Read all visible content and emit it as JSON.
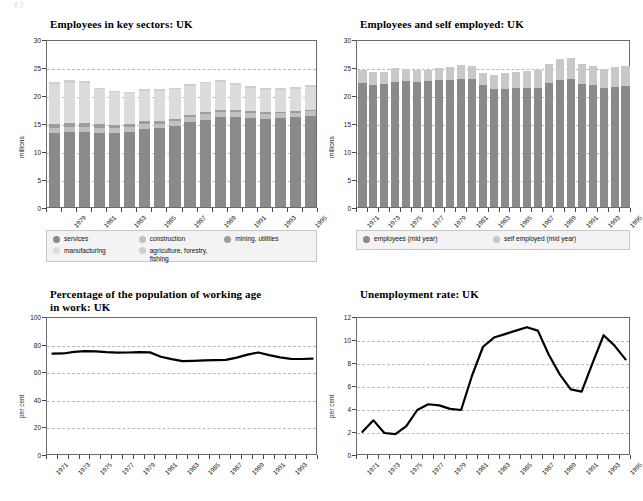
{
  "page": {
    "artifact": "g  y"
  },
  "charts": [
    {
      "id": "employees-key-sectors",
      "title": "Employees in key sectors: UK",
      "ylabel": "millions",
      "ylim": [
        0,
        30
      ],
      "yticks": [
        0,
        5,
        10,
        15,
        20,
        25,
        30
      ],
      "gridlines": [
        5,
        10,
        15,
        20,
        25
      ],
      "type": "bar",
      "legend": [
        {
          "label": "services",
          "color": "#8a8a8a"
        },
        {
          "label": "construction",
          "color": "#c0c0c0"
        },
        {
          "label": "mining, utilities",
          "color": "#9d9d9d"
        },
        {
          "label": "manufacturing",
          "color": "#dcdcdc"
        },
        {
          "label": "agriculture, forestry, fishing",
          "color": "#cfcfcf"
        }
      ],
      "categories": [
        "1978",
        "1979",
        "1980",
        "1981",
        "1982",
        "1983",
        "1984",
        "1985",
        "1986",
        "1987",
        "1988",
        "1989",
        "1990",
        "1991",
        "1992",
        "1993",
        "1994",
        "1995"
      ],
      "tick_labels": [
        "1979",
        "1981",
        "1983",
        "1985",
        "1987",
        "1989",
        "1991",
        "1993",
        "1995"
      ],
      "series": [
        {
          "name": "services",
          "values": [
            13.2,
            13.4,
            13.4,
            13.3,
            13.3,
            13.4,
            14.0,
            14.1,
            14.5,
            15.1,
            15.6,
            16.0,
            16.0,
            15.9,
            15.8,
            15.9,
            16.0,
            16.3
          ]
        },
        {
          "name": "construction",
          "values": [
            0.9,
            0.9,
            0.9,
            0.8,
            0.8,
            0.8,
            0.8,
            0.8,
            0.8,
            0.9,
            1.0,
            1.0,
            1.0,
            0.9,
            0.8,
            0.8,
            0.8,
            0.8
          ]
        },
        {
          "name": "mining, utilities",
          "values": [
            0.7,
            0.7,
            0.7,
            0.7,
            0.6,
            0.6,
            0.6,
            0.5,
            0.5,
            0.4,
            0.4,
            0.4,
            0.3,
            0.3,
            0.3,
            0.3,
            0.3,
            0.3
          ]
        },
        {
          "name": "manufacturing",
          "values": [
            7.1,
            7.2,
            7.1,
            6.2,
            5.8,
            5.5,
            5.3,
            5.3,
            5.2,
            5.2,
            5.1,
            5.0,
            4.5,
            4.2,
            4.0,
            3.9,
            4.0,
            4.0
          ]
        },
        {
          "name": "agriculture, forestry, fishing",
          "values": [
            0.4,
            0.4,
            0.4,
            0.3,
            0.3,
            0.3,
            0.3,
            0.3,
            0.3,
            0.3,
            0.3,
            0.3,
            0.3,
            0.3,
            0.3,
            0.3,
            0.3,
            0.3
          ]
        }
      ]
    },
    {
      "id": "employees-self-employed",
      "title": "Employees and self employed: UK",
      "ylabel": "millions",
      "ylim": [
        0,
        30
      ],
      "yticks": [
        0,
        5,
        10,
        15,
        20,
        25,
        30
      ],
      "gridlines": [
        5,
        10,
        15,
        20,
        25
      ],
      "type": "bar",
      "legend": [
        {
          "label": "employees (mid year)",
          "color": "#8a8a8a"
        },
        {
          "label": "self employed (mid year)",
          "color": "#c8c8c8"
        }
      ],
      "categories": [
        "1971",
        "1972",
        "1973",
        "1974",
        "1975",
        "1976",
        "1977",
        "1978",
        "1979",
        "1980",
        "1981",
        "1982",
        "1983",
        "1984",
        "1985",
        "1986",
        "1987",
        "1988",
        "1989",
        "1990",
        "1991",
        "1992",
        "1993",
        "1994",
        "1995"
      ],
      "tick_labels": [
        "1971",
        "1973",
        "1975",
        "1977",
        "1979",
        "1981",
        "1983",
        "1985",
        "1987",
        "1989",
        "1991",
        "1993",
        "1995"
      ],
      "series": [
        {
          "name": "employees (mid year)",
          "values": [
            22.1,
            21.8,
            21.9,
            22.4,
            22.5,
            22.4,
            22.5,
            22.6,
            22.7,
            22.9,
            22.9,
            21.7,
            21.1,
            21.1,
            21.2,
            21.2,
            21.3,
            22.1,
            22.6,
            22.8,
            22.0,
            21.8,
            21.3,
            21.5,
            21.6
          ]
        },
        {
          "name": "self employed (mid year)",
          "values": [
            2.3,
            2.3,
            2.2,
            2.4,
            2.2,
            2.1,
            2.0,
            2.3,
            2.3,
            2.4,
            2.2,
            2.3,
            2.5,
            2.8,
            2.9,
            3.0,
            3.2,
            3.5,
            3.8,
            3.8,
            3.6,
            3.3,
            3.3,
            3.5,
            3.6
          ]
        }
      ]
    },
    {
      "id": "working-age-in-work",
      "title": "Percentage of the population of working age in work: UK",
      "ylabel": "per cent",
      "ylim": [
        0,
        100
      ],
      "yticks": [
        0,
        20,
        40,
        60,
        80,
        100
      ],
      "gridlines": [
        20,
        40,
        60,
        80
      ],
      "type": "line",
      "x": [
        "1971",
        "1972",
        "1973",
        "1974",
        "1975",
        "1976",
        "1977",
        "1978",
        "1979",
        "1980",
        "1981",
        "1982",
        "1983",
        "1984",
        "1985",
        "1986",
        "1987",
        "1988",
        "1989",
        "1990",
        "1991",
        "1992",
        "1993",
        "1994",
        "1995"
      ],
      "tick_labels": [
        "1971",
        "1973",
        "1975",
        "1977",
        "1979",
        "1981",
        "1983",
        "1985",
        "1987",
        "1989",
        "1991",
        "1993"
      ],
      "values": [
        74.2,
        74.3,
        75.5,
        76.0,
        75.8,
        75.2,
        74.9,
        75.0,
        75.2,
        75.1,
        71.9,
        70.2,
        68.8,
        69.0,
        69.3,
        69.5,
        69.6,
        71.3,
        73.5,
        75.0,
        73.1,
        71.5,
        70.4,
        70.3,
        70.5
      ]
    },
    {
      "id": "unemployment-rate",
      "title": "Unemployment rate: UK",
      "ylabel": "per cent",
      "ylim": [
        0,
        12
      ],
      "yticks": [
        0,
        2,
        4,
        6,
        8,
        10,
        12
      ],
      "gridlines": [
        2,
        4,
        6,
        8,
        10
      ],
      "type": "line",
      "x": [
        "1971",
        "1972",
        "1973",
        "1974",
        "1975",
        "1976",
        "1977",
        "1978",
        "1979",
        "1980",
        "1981",
        "1982",
        "1983",
        "1984",
        "1985",
        "1986",
        "1987",
        "1988",
        "1989",
        "1990",
        "1991",
        "1992",
        "1993",
        "1994",
        "1995"
      ],
      "tick_labels": [
        "1971",
        "1973",
        "1975",
        "1977",
        "1979",
        "1981",
        "1983",
        "1985",
        "1987",
        "1989",
        "1991",
        "1993",
        "1995"
      ],
      "values": [
        2.1,
        3.1,
        2.0,
        1.9,
        2.6,
        4.0,
        4.5,
        4.4,
        4.1,
        4.0,
        7.0,
        9.5,
        10.3,
        10.6,
        10.9,
        11.2,
        10.9,
        8.8,
        7.1,
        5.8,
        5.6,
        8.1,
        10.5,
        9.6,
        8.4
      ]
    }
  ]
}
